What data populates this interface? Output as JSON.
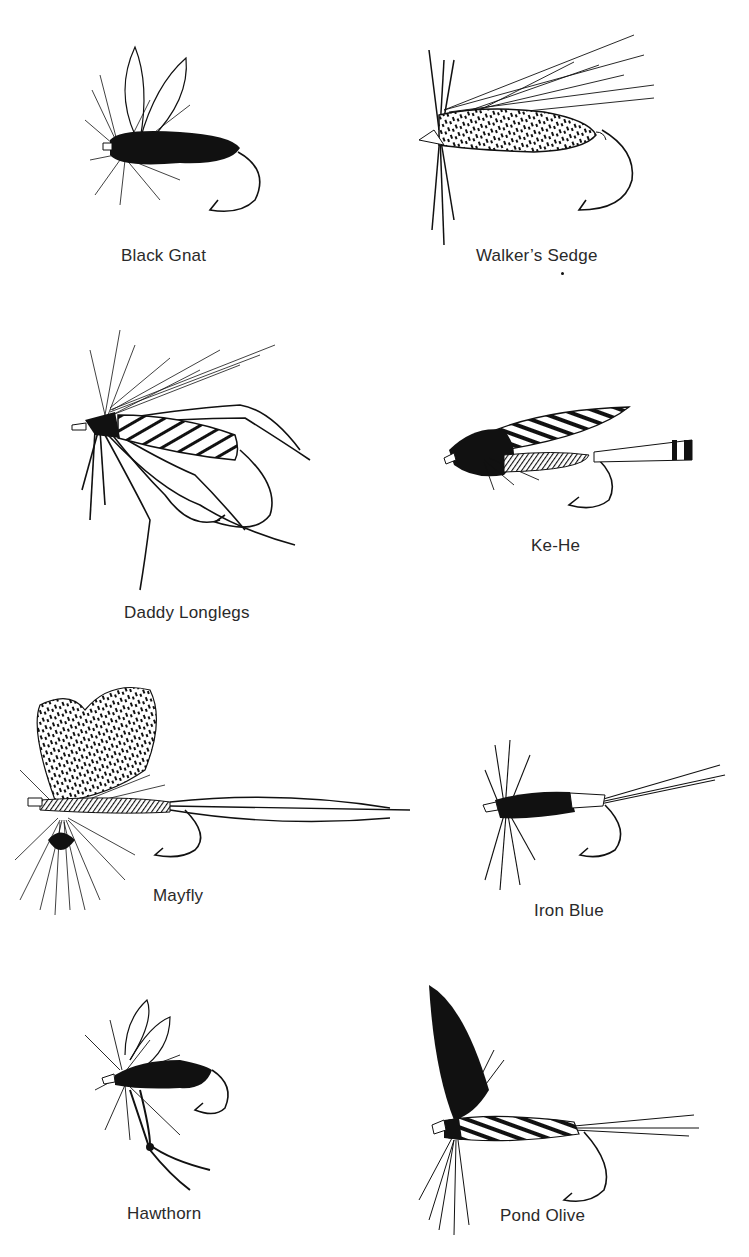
{
  "page": {
    "background": "#ffffff",
    "ink_color": "#111111"
  },
  "flies": [
    {
      "name": "Black Gnat",
      "caption": "Black Gnat"
    },
    {
      "name": "Walker's Sedge",
      "caption": "Walker’s Sedge"
    },
    {
      "name": "Daddy Longlegs",
      "caption": "Daddy Longlegs"
    },
    {
      "name": "Ke-He",
      "caption": "Ke-He"
    },
    {
      "name": "Mayfly",
      "caption": "Mayfly"
    },
    {
      "name": "Iron Blue",
      "caption": "Iron Blue"
    },
    {
      "name": "Hawthorn",
      "caption": "Hawthorn"
    },
    {
      "name": "Pond Olive",
      "caption": "Pond Olive"
    }
  ]
}
